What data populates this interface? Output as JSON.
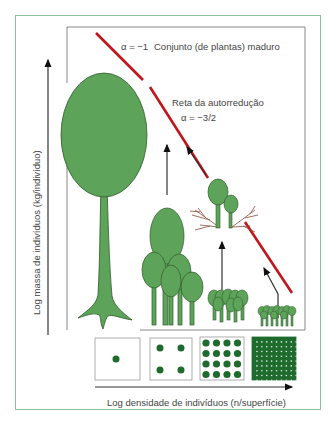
{
  "diagram": {
    "y_axis_label": "Log massa de indivíduos (kg/indivíduo)",
    "x_axis_label": "Log densidade de indivíduos (n/superfície)",
    "annotations": {
      "mature_stand": "Conjunto (de plantas) maduro",
      "alpha_mature": "α = −1",
      "self_thinning_line": "Reta da autorredução",
      "alpha_self_thinning": "α = −3/2"
    },
    "density_boxes": [
      {
        "dots": 1,
        "label": "1 individual"
      },
      {
        "dots": 4,
        "label": "4 individuals"
      },
      {
        "dots": 16,
        "label": "16 individuals"
      },
      {
        "dots": 100,
        "label": "dense grid"
      }
    ],
    "colors": {
      "tree_fill": "#5ea35a",
      "tree_stroke": "#2f5a2c",
      "line_red": "#c0161b",
      "dot_green": "#1f6b2e",
      "frame_green": "#8fc29a",
      "frame_gray": "#888888",
      "dead_branch": "#8b4a3a"
    }
  }
}
